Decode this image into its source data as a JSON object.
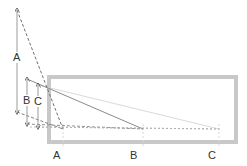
{
  "diagram": {
    "type": "perspective-projection-diagram",
    "colors": {
      "background": "#ffffff",
      "frame": "#c8c8c8",
      "dark_line": "#6e6e6e",
      "mid_line": "#9a9a9a",
      "light_line": "#d0d0d0",
      "label": "#333333"
    },
    "left_arrows": [
      {
        "label": "A",
        "x": 17,
        "y_top": 10,
        "y_bottom": 112,
        "label_x": 13,
        "label_y": 52
      },
      {
        "label": "B",
        "x": 27,
        "y_top": 79,
        "y_bottom": 124,
        "label_x": 23,
        "label_y": 95
      },
      {
        "label": "C",
        "x": 38,
        "y_top": 85,
        "y_bottom": 127,
        "label_x": 34,
        "label_y": 96
      }
    ],
    "bottom_points": [
      {
        "label": "A",
        "x": 63,
        "y": 129,
        "label_x": 53,
        "label_y": 150
      },
      {
        "label": "B",
        "x": 143,
        "y": 129,
        "label_x": 130,
        "label_y": 150
      },
      {
        "label": "C",
        "x": 219,
        "y": 129,
        "label_x": 208,
        "label_y": 150
      }
    ],
    "frame": {
      "x": 47,
      "y": 75,
      "width": 191,
      "height": 69,
      "stroke": 4
    }
  }
}
